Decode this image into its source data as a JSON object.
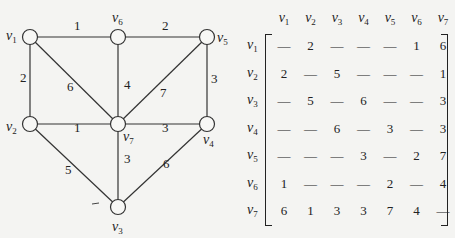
{
  "graph": {
    "vertices": [
      {
        "id": "v1",
        "name": "v",
        "sub": "1",
        "x": 30,
        "y": 37
      },
      {
        "id": "v2",
        "name": "v",
        "sub": "2",
        "x": 30,
        "y": 124
      },
      {
        "id": "v3",
        "name": "v",
        "sub": "3",
        "x": 118,
        "y": 207
      },
      {
        "id": "v4",
        "name": "v",
        "sub": "4",
        "x": 207,
        "y": 124
      },
      {
        "id": "v5",
        "name": "v",
        "sub": "5",
        "x": 207,
        "y": 37
      },
      {
        "id": "v6",
        "name": "v",
        "sub": "6",
        "x": 118,
        "y": 37
      },
      {
        "id": "v7",
        "name": "v",
        "sub": "7",
        "x": 118,
        "y": 124
      }
    ],
    "edges": [
      {
        "from": "v1",
        "to": "v6",
        "weight": "1"
      },
      {
        "from": "v6",
        "to": "v5",
        "weight": "2"
      },
      {
        "from": "v1",
        "to": "v2",
        "weight": "2"
      },
      {
        "from": "v1",
        "to": "v7",
        "weight": "6"
      },
      {
        "from": "v6",
        "to": "v7",
        "weight": "4"
      },
      {
        "from": "v5",
        "to": "v7",
        "weight": "7"
      },
      {
        "from": "v5",
        "to": "v4",
        "weight": "3"
      },
      {
        "from": "v2",
        "to": "v7",
        "weight": "1"
      },
      {
        "from": "v7",
        "to": "v4",
        "weight": "3"
      },
      {
        "from": "v2",
        "to": "v3",
        "weight": "5"
      },
      {
        "from": "v7",
        "to": "v3",
        "weight": "3"
      },
      {
        "from": "v4",
        "to": "v3",
        "weight": "6"
      }
    ]
  },
  "matrix": {
    "col_headers": [
      "1",
      "2",
      "3",
      "4",
      "5",
      "6",
      "7"
    ],
    "row_headers": [
      "1",
      "2",
      "3",
      "4",
      "5",
      "6",
      "7"
    ],
    "header_var": "v",
    "empty_symbol": "—",
    "rows": [
      [
        "—",
        "2",
        "—",
        "—",
        "—",
        "1",
        "6"
      ],
      [
        "2",
        "—",
        "5",
        "—",
        "—",
        "—",
        "1"
      ],
      [
        "—",
        "5",
        "—",
        "6",
        "—",
        "—",
        "3"
      ],
      [
        "—",
        "—",
        "6",
        "—",
        "3",
        "—",
        "3"
      ],
      [
        "—",
        "—",
        "—",
        "3",
        "—",
        "2",
        "7"
      ],
      [
        "1",
        "—",
        "—",
        "—",
        "2",
        "—",
        "4"
      ],
      [
        "6",
        "1",
        "3",
        "3",
        "7",
        "4",
        "—"
      ]
    ]
  }
}
